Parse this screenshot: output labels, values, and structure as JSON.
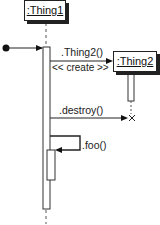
{
  "diagram": {
    "type": "uml-sequence",
    "lifelines": [
      {
        "id": "thing1",
        "label": ":Thing1"
      },
      {
        "id": "thing2",
        "label": ":Thing2"
      }
    ],
    "messages": [
      {
        "from": "found",
        "to": "thing1",
        "kind": "found-message",
        "label": ""
      },
      {
        "from": "thing1",
        "to": "thing2",
        "kind": "create",
        "label": ".Thing2()",
        "stereotype": "<< create >>"
      },
      {
        "from": "thing1",
        "to": "thing2",
        "kind": "destroy",
        "label": ".destroy()"
      },
      {
        "from": "thing1",
        "to": "thing1",
        "kind": "self",
        "label": ".foo()"
      }
    ],
    "colors": {
      "line": "#222222",
      "background": "#ffffff"
    }
  }
}
